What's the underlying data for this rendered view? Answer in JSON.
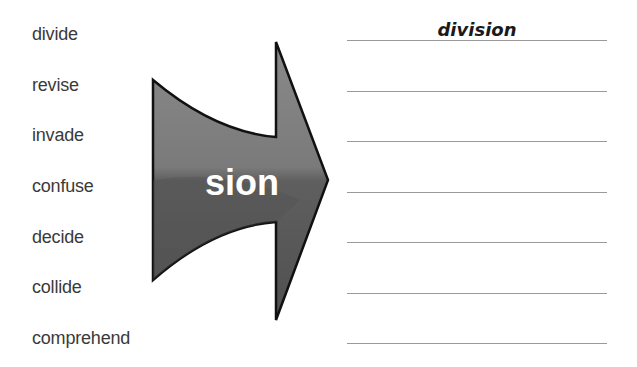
{
  "base_words": [
    "divide",
    "revise",
    "invade",
    "confuse",
    "decide",
    "collide",
    "comprehend"
  ],
  "arrow": {
    "suffix": "sion",
    "fill_color": "#6f6f6f",
    "outline_color": "#111111"
  },
  "answers": [
    "division",
    "",
    "",
    "",
    "",
    "",
    ""
  ]
}
